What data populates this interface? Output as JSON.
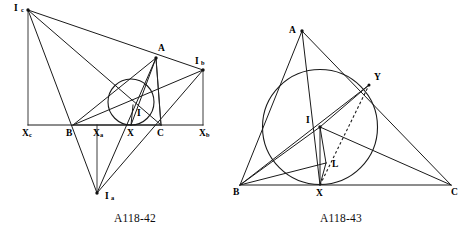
{
  "page": {
    "background_color": "#ffffff",
    "ink_color": "#1a1a1a",
    "width": 469,
    "height": 236
  },
  "figures": [
    {
      "id": "fig-left",
      "caption": "A118-42",
      "caption_x": 135,
      "caption_y": 219,
      "description": "Triangle ABC with incircle, incenter I and the three excenters Ia, Ib, Ic, with feet Xa, Xb, Xc on line BC",
      "points": {
        "Ic": {
          "label": "I",
          "sub": "c",
          "x": 28,
          "y": 10,
          "lx": 14,
          "ly": 9
        },
        "A": {
          "label": "A",
          "sub": "",
          "x": 156,
          "y": 58,
          "lx": 158,
          "ly": 49
        },
        "Ib": {
          "label": "I",
          "sub": "b",
          "x": 203,
          "y": 70,
          "lx": 195,
          "ly": 62
        },
        "B": {
          "label": "B",
          "sub": "",
          "x": 73,
          "y": 125,
          "lx": 66,
          "ly": 133
        },
        "C": {
          "label": "C",
          "sub": "",
          "x": 161,
          "y": 125,
          "lx": 159,
          "ly": 133
        },
        "I": {
          "label": "I",
          "sub": "",
          "x": 133,
          "y": 105,
          "lx": 137,
          "ly": 113
        },
        "X": {
          "label": "X",
          "sub": "",
          "x": 131,
          "y": 125,
          "lx": 131,
          "ly": 133
        },
        "Xa": {
          "label": "X",
          "sub": "a",
          "x": 97,
          "y": 125,
          "lx": 101,
          "ly": 133
        },
        "Xb": {
          "label": "X",
          "sub": "b",
          "x": 203,
          "y": 125,
          "lx": 205,
          "ly": 133
        },
        "Xc": {
          "label": "X",
          "sub": "c",
          "x": 28,
          "y": 125,
          "lx": 28,
          "ly": 133
        },
        "Ia": {
          "label": "I",
          "sub": "a",
          "x": 97,
          "y": 193,
          "lx": 106,
          "ly": 197
        }
      },
      "incircle": {
        "cx": 131,
        "cy": 102,
        "r": 23
      }
    },
    {
      "id": "fig-right",
      "caption": "A118-43",
      "caption_x": 341,
      "caption_y": 219,
      "description": "Triangle ABC with inscribed circle centred at I, contact point X on BC, point Y on AC, foot L, and dashed segment XY",
      "points": {
        "A": {
          "label": "A",
          "sub": "",
          "x": 302,
          "y": 31,
          "lx": 291,
          "ly": 31
        },
        "B": {
          "label": "B",
          "sub": "",
          "x": 240,
          "y": 185,
          "lx": 236,
          "ly": 193
        },
        "C": {
          "label": "C",
          "sub": "",
          "x": 451,
          "y": 185,
          "lx": 453,
          "ly": 193
        },
        "I": {
          "label": "I",
          "sub": "",
          "x": 320,
          "y": 127,
          "lx": 308,
          "ly": 121
        },
        "X": {
          "label": "X",
          "sub": "",
          "x": 320,
          "y": 185,
          "lx": 320,
          "ly": 193
        },
        "Y": {
          "label": "Y",
          "sub": "",
          "x": 369,
          "y": 85,
          "lx": 376,
          "ly": 78
        },
        "L": {
          "label": "L",
          "sub": "",
          "x": 326,
          "y": 163,
          "lx": 334,
          "ly": 165
        }
      },
      "incircle": {
        "cx": 320,
        "cy": 127,
        "r": 57.5
      }
    }
  ]
}
